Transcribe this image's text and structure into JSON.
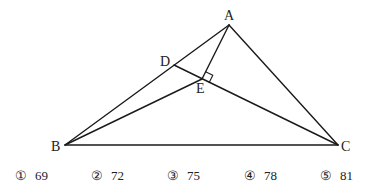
{
  "diagram": {
    "points": {
      "A": {
        "label": "A",
        "x": 229,
        "y": 25,
        "lx": 229,
        "ly": 17
      },
      "B": {
        "label": "B",
        "x": 65,
        "y": 145,
        "lx": 57,
        "ly": 150
      },
      "C": {
        "label": "C",
        "x": 338,
        "y": 145,
        "lx": 346,
        "ly": 150
      },
      "D": {
        "label": "D",
        "x": 174,
        "y": 65,
        "lx": 166,
        "ly": 63
      },
      "E": {
        "label": "E",
        "x": 202,
        "y": 79,
        "lx": 202,
        "ly": 93
      }
    },
    "segments": [
      [
        "A",
        "B"
      ],
      [
        "A",
        "C"
      ],
      [
        "B",
        "C"
      ],
      [
        "D",
        "C"
      ],
      [
        "B",
        "E"
      ],
      [
        "A",
        "E"
      ]
    ],
    "right_angle_at": "E",
    "stroke_color": "#1a1a1a"
  },
  "choices": [
    {
      "marker": "①",
      "value": "69",
      "x": 30
    },
    {
      "marker": "②",
      "value": "72",
      "x": 105
    },
    {
      "marker": "③",
      "value": "75",
      "x": 181
    },
    {
      "marker": "④",
      "value": "78",
      "x": 256
    },
    {
      "marker": "⑤",
      "value": "81",
      "x": 331
    }
  ]
}
